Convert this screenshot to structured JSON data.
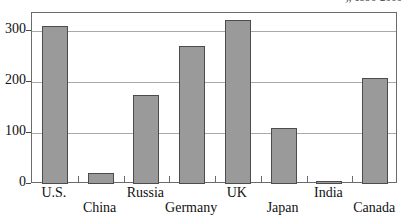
{
  "chart_data": {
    "type": "bar",
    "title": "), 1990-2000",
    "title_note": "title cropped at top edge of screenshot; only descender sliver legible",
    "xlabel": "",
    "ylabel": "",
    "categories": [
      "U.S.",
      "China",
      "Russia",
      "Germany",
      "UK",
      "Japan",
      "India",
      "Canada"
    ],
    "values": [
      310,
      22,
      175,
      270,
      322,
      110,
      6,
      208
    ],
    "ylim": [
      0,
      340
    ],
    "yticks": [
      0,
      100,
      200,
      300
    ],
    "ytick_labels": [
      "0",
      "100",
      "200",
      "300"
    ],
    "grid": true,
    "grid_axis": "y",
    "legend": false,
    "bar_fill": "#9a9a9a",
    "bar_border": "#4c4c4c",
    "frame_color": "#6b6b6b",
    "gridline_color": "#a8a8a8",
    "background": "#ffffff",
    "label_rows": [
      0,
      1,
      0,
      1,
      0,
      1,
      0,
      1
    ]
  }
}
